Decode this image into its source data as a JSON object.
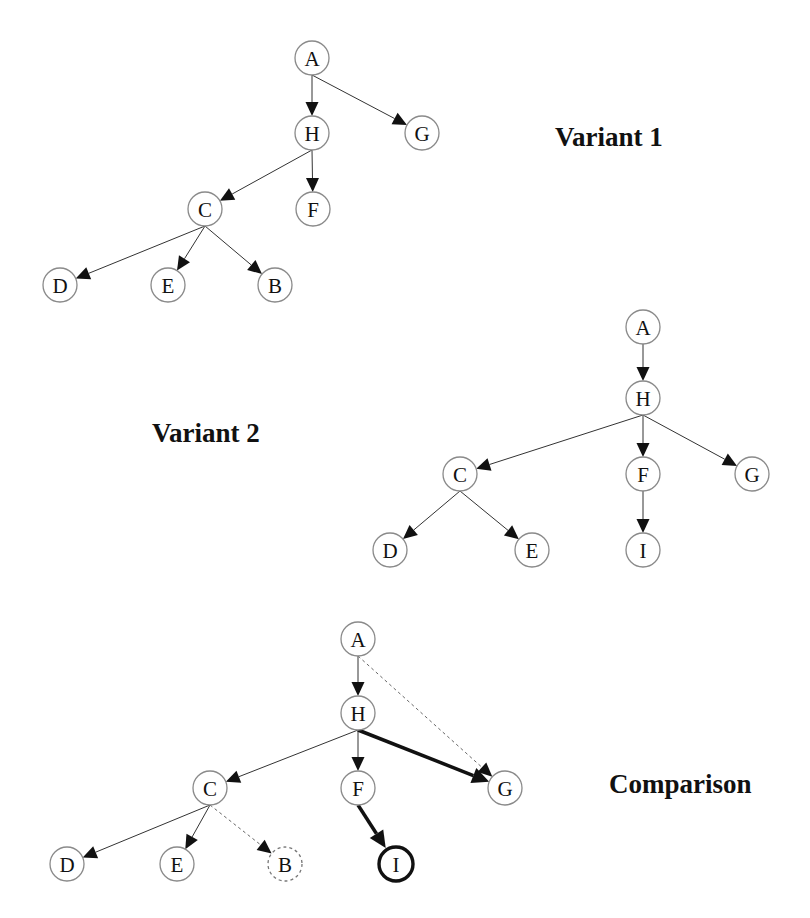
{
  "labels": {
    "variant1": "Variant 1",
    "variant2": "Variant 2",
    "comparison": "Comparison"
  },
  "colors": {
    "node_stroke": "#8a8a8a",
    "edge": "#333333",
    "highlight": "#111111",
    "background": "#ffffff"
  },
  "panels": [
    {
      "id": "variant1",
      "nodes": [
        {
          "id": "A",
          "x": 312,
          "y": 58,
          "style": "normal"
        },
        {
          "id": "H",
          "x": 312,
          "y": 133,
          "style": "normal"
        },
        {
          "id": "G",
          "x": 422,
          "y": 133,
          "style": "normal"
        },
        {
          "id": "C",
          "x": 205,
          "y": 209,
          "style": "normal"
        },
        {
          "id": "F",
          "x": 313,
          "y": 209,
          "style": "normal"
        },
        {
          "id": "D",
          "x": 60,
          "y": 285,
          "style": "normal"
        },
        {
          "id": "E",
          "x": 168,
          "y": 285,
          "style": "normal"
        },
        {
          "id": "B",
          "x": 275,
          "y": 285,
          "style": "normal"
        }
      ],
      "edges": [
        {
          "from": "A",
          "to": "H",
          "style": "normal"
        },
        {
          "from": "A",
          "to": "G",
          "style": "normal"
        },
        {
          "from": "H",
          "to": "C",
          "style": "normal"
        },
        {
          "from": "H",
          "to": "F",
          "style": "normal"
        },
        {
          "from": "C",
          "to": "D",
          "style": "normal"
        },
        {
          "from": "C",
          "to": "E",
          "style": "normal"
        },
        {
          "from": "C",
          "to": "B",
          "style": "normal"
        }
      ]
    },
    {
      "id": "variant2",
      "nodes": [
        {
          "id": "A",
          "x": 643,
          "y": 327,
          "style": "normal"
        },
        {
          "id": "H",
          "x": 643,
          "y": 398,
          "style": "normal"
        },
        {
          "id": "C",
          "x": 460,
          "y": 474,
          "style": "normal"
        },
        {
          "id": "F",
          "x": 643,
          "y": 474,
          "style": "normal"
        },
        {
          "id": "G",
          "x": 752,
          "y": 474,
          "style": "normal"
        },
        {
          "id": "D",
          "x": 390,
          "y": 550,
          "style": "normal"
        },
        {
          "id": "E",
          "x": 532,
          "y": 550,
          "style": "normal"
        },
        {
          "id": "I",
          "x": 643,
          "y": 550,
          "style": "normal"
        }
      ],
      "edges": [
        {
          "from": "A",
          "to": "H",
          "style": "normal"
        },
        {
          "from": "H",
          "to": "C",
          "style": "normal"
        },
        {
          "from": "H",
          "to": "F",
          "style": "normal"
        },
        {
          "from": "H",
          "to": "G",
          "style": "normal"
        },
        {
          "from": "C",
          "to": "D",
          "style": "normal"
        },
        {
          "from": "C",
          "to": "E",
          "style": "normal"
        },
        {
          "from": "F",
          "to": "I",
          "style": "normal"
        }
      ]
    },
    {
      "id": "comparison",
      "nodes": [
        {
          "id": "A",
          "x": 358,
          "y": 639,
          "style": "normal"
        },
        {
          "id": "H",
          "x": 358,
          "y": 713,
          "style": "normal"
        },
        {
          "id": "C",
          "x": 210,
          "y": 788,
          "style": "normal"
        },
        {
          "id": "F",
          "x": 358,
          "y": 788,
          "style": "normal"
        },
        {
          "id": "G",
          "x": 505,
          "y": 788,
          "style": "normal"
        },
        {
          "id": "D",
          "x": 67,
          "y": 864,
          "style": "normal"
        },
        {
          "id": "E",
          "x": 177,
          "y": 864,
          "style": "normal"
        },
        {
          "id": "B",
          "x": 285,
          "y": 864,
          "style": "dashed"
        },
        {
          "id": "I",
          "x": 396,
          "y": 864,
          "style": "bold"
        }
      ],
      "edges": [
        {
          "from": "A",
          "to": "H",
          "style": "normal"
        },
        {
          "from": "A",
          "to": "G",
          "style": "dashed"
        },
        {
          "from": "H",
          "to": "C",
          "style": "normal"
        },
        {
          "from": "H",
          "to": "F",
          "style": "normal"
        },
        {
          "from": "H",
          "to": "G",
          "style": "bold"
        },
        {
          "from": "C",
          "to": "D",
          "style": "normal"
        },
        {
          "from": "C",
          "to": "E",
          "style": "normal"
        },
        {
          "from": "C",
          "to": "B",
          "style": "dashed"
        },
        {
          "from": "F",
          "to": "I",
          "style": "bold"
        }
      ]
    }
  ]
}
